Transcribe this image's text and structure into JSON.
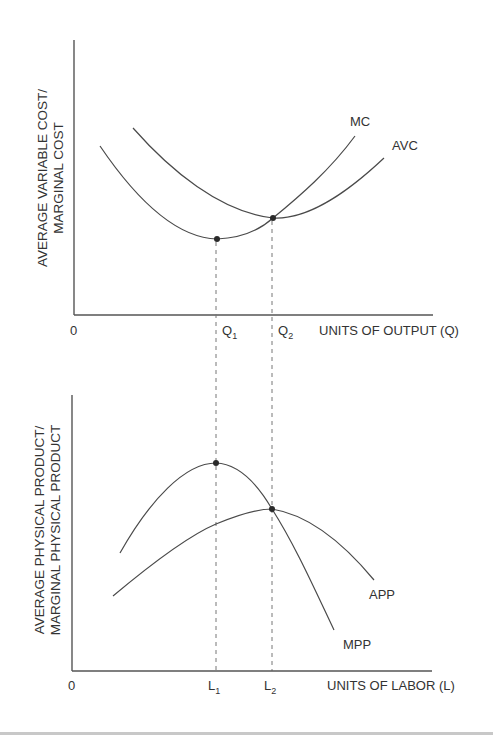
{
  "top_chart": {
    "y_label_line1": "AVERAGE VARIABLE COST/",
    "y_label_line2": "MARGINAL COST",
    "x_label": "UNITS OF OUTPUT (Q)",
    "origin": "0",
    "q1": {
      "base": "Q",
      "sub": "1"
    },
    "q2": {
      "base": "Q",
      "sub": "2"
    },
    "curve_labels": {
      "mc": "MC",
      "avc": "AVC"
    }
  },
  "bottom_chart": {
    "y_label_line1": "AVERAGE PHYSICAL PRODUCT/",
    "y_label_line2": "MARGINAL PHYSICAL PRODUCT",
    "x_label": "UNITS OF LABOR (L)",
    "origin": "0",
    "l1": {
      "base": "L",
      "sub": "1"
    },
    "l2": {
      "base": "L",
      "sub": "2"
    },
    "curve_labels": {
      "app": "APP",
      "mpp": "MPP"
    }
  },
  "colors": {
    "line": "#4a4a4a",
    "text": "#333333",
    "guide": "#777777"
  }
}
